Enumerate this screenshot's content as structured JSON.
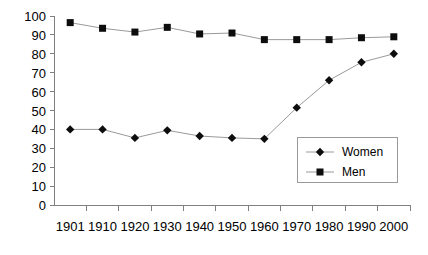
{
  "chart_data": {
    "type": "line",
    "title": "",
    "xlabel": "",
    "ylabel": "",
    "categories": [
      "1901",
      "1910",
      "1920",
      "1930",
      "1940",
      "1950",
      "1960",
      "1970",
      "1980",
      "1990",
      "2000"
    ],
    "series": [
      {
        "name": "Women",
        "marker": "diamond",
        "color": "#0d0d0d",
        "values": [
          40,
          40,
          35.5,
          39.5,
          36.5,
          35.5,
          35,
          51.5,
          66,
          75.5,
          80
        ]
      },
      {
        "name": "Men",
        "marker": "square",
        "color": "#0d0d0d",
        "values": [
          96.5,
          93.5,
          91.5,
          94,
          90.5,
          91,
          87.5,
          87.5,
          87.5,
          88.5,
          89
        ]
      }
    ],
    "ylim": [
      0,
      100
    ],
    "y_ticks": [
      "0",
      "10",
      "20",
      "30",
      "40",
      "50",
      "60",
      "70",
      "80",
      "90",
      "100"
    ],
    "grid": false,
    "legend_position": "inside-lower-right",
    "line_color": "#9a9a9a",
    "axis_color": "#808080"
  },
  "legend": {
    "entries": [
      {
        "label": "Women"
      },
      {
        "label": "Men"
      }
    ]
  },
  "axes": {
    "y_tick_labels": [
      "100",
      "90",
      "80",
      "70",
      "60",
      "50",
      "40",
      "30",
      "20",
      "10",
      "0"
    ],
    "x_tick_labels": [
      "1901",
      "1910",
      "1920",
      "1930",
      "1940",
      "1950",
      "1960",
      "1970",
      "1980",
      "1990",
      "2000"
    ]
  }
}
